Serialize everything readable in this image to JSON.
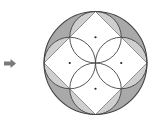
{
  "diagram": {
    "arrow": {
      "icon": "right-arrow-icon",
      "color": "#7a7a7a",
      "x": 4,
      "y": 59,
      "width": 12,
      "height": 9
    },
    "outer_circle": {
      "cx": 95.5,
      "cy": 63,
      "r": 51.5,
      "stroke": "#444444",
      "fill_dark": "#a9a9a9",
      "fill_light": "#cfcfcf"
    },
    "inscribed_square": {
      "vertices": [
        [
          95.5,
          11.5
        ],
        [
          147,
          63
        ],
        [
          95.5,
          114.5
        ],
        [
          44,
          63
        ]
      ],
      "fill": "#ffffff",
      "stroke": "#555555"
    },
    "small_circles": [
      {
        "cx": 95.5,
        "cy": 37.25,
        "r": 25.75
      },
      {
        "cx": 121.25,
        "cy": 63,
        "r": 25.75
      },
      {
        "cx": 95.5,
        "cy": 88.75,
        "r": 25.75
      },
      {
        "cx": 69.75,
        "cy": 63,
        "r": 25.75
      }
    ],
    "center_dots": [
      {
        "cx": 95.5,
        "cy": 37.25
      },
      {
        "cx": 121.25,
        "cy": 63
      },
      {
        "cx": 95.5,
        "cy": 88.75
      },
      {
        "cx": 69.75,
        "cy": 63
      }
    ],
    "stroke_color": "#444444",
    "dot_color": "#222222"
  }
}
